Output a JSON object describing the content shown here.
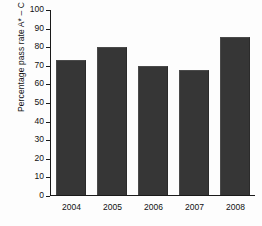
{
  "chart_data": {
    "type": "bar",
    "title": "",
    "xlabel": "",
    "ylabel": "Percentage pass rate A* – C",
    "categories": [
      "2004",
      "2005",
      "2006",
      "2007",
      "2008"
    ],
    "values": [
      72.5,
      79.5,
      69.5,
      67,
      85
    ],
    "ylim": [
      0,
      100
    ],
    "ytick_step": 10,
    "yticks": [
      "100",
      "90",
      "80",
      "70",
      "60",
      "50",
      "40",
      "30",
      "20",
      "10",
      "0"
    ],
    "ytick_values": [
      100,
      90,
      80,
      70,
      60,
      50,
      40,
      30,
      20,
      10,
      0
    ],
    "grid": false,
    "legend": false,
    "series": [
      {
        "name": "Percentage pass rate A* – C",
        "values": [
          72.5,
          79.5,
          69.5,
          67,
          85
        ]
      }
    ],
    "colors": {
      "bar": "#363636",
      "axis": "#1a1a1a",
      "background": "#fdfdfd",
      "text": "#111111"
    }
  }
}
